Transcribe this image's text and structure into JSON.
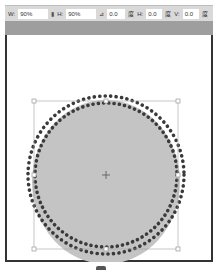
{
  "toolbar": {
    "width_label": "W:",
    "width_value": "90%",
    "link_icon": "chain-link-icon",
    "height_label": "H:",
    "height_value": "90%",
    "rotate_label": "⊿",
    "rotate_value": "0.0",
    "rotate_unit": "度",
    "skew_h_label": "H:",
    "skew_h_value": "0.0",
    "skew_h_unit": "度",
    "skew_v_label": "V:",
    "skew_v_value": "0.0",
    "skew_v_unit": "度"
  },
  "canvas": {
    "shape": "circle",
    "fill_color": "#c4c4c4",
    "dot_color": "#3a3a3a",
    "bounding_box": {
      "x": 34,
      "y": 101,
      "w": 144,
      "h": 148
    },
    "center": {
      "x": 106,
      "y": 175
    }
  }
}
